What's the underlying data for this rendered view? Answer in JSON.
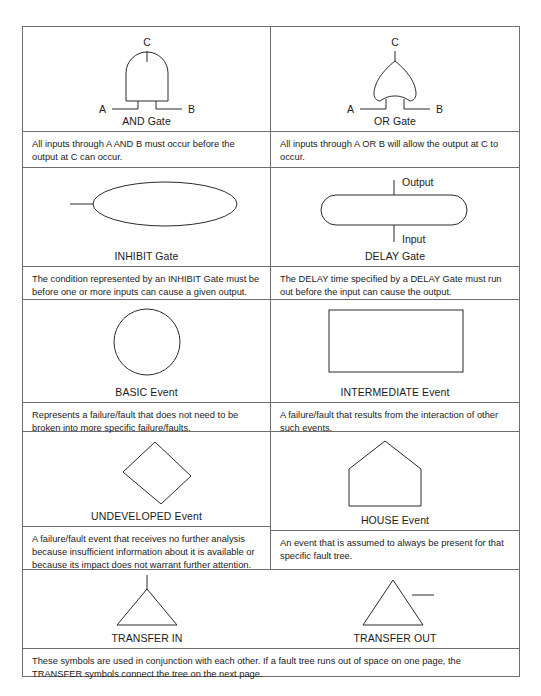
{
  "document": {
    "title": "Fault Tree Analysis Symbols",
    "type": "reference-table",
    "border_color": "#6e6e6e",
    "stroke_color": "#2a2a2a",
    "background": "#ffffff"
  },
  "rows": [
    {
      "cells": [
        {
          "symbol": "and-gate",
          "caption": "AND Gate",
          "labels": {
            "output": "C",
            "input_left": "A",
            "input_right": "B"
          },
          "description": "All inputs through A AND B must occur before the output at C can occur."
        },
        {
          "symbol": "or-gate",
          "caption": "OR Gate",
          "labels": {
            "output": "C",
            "input_left": "A",
            "input_right": "B"
          },
          "description": "All inputs through A OR B will allow the output at C to occur."
        }
      ]
    },
    {
      "cells": [
        {
          "symbol": "inhibit-gate",
          "caption": "INHIBIT Gate",
          "labels": {},
          "description": "The condition represented by an INHIBIT Gate must be before one or more inputs can cause a given output."
        },
        {
          "symbol": "delay-gate",
          "caption": "DELAY Gate",
          "labels": {
            "output": "Output",
            "input": "Input"
          },
          "description": "The DELAY time specified by a DELAY Gate must run out before the input can cause the output."
        }
      ]
    },
    {
      "cells": [
        {
          "symbol": "basic-event",
          "caption": "BASIC Event",
          "labels": {},
          "description": "Represents a failure/fault that does not need to be broken into more specific failure/faults."
        },
        {
          "symbol": "intermediate-event",
          "caption": "INTERMEDIATE Event",
          "labels": {},
          "description": "A failure/fault that results from the interaction of other such events."
        }
      ]
    },
    {
      "cells": [
        {
          "symbol": "undeveloped-event",
          "caption": "UNDEVELOPED Event",
          "labels": {},
          "description": "A failure/fault event that receives no further analysis because insufficient information about it is available or because its impact does not warrant further attention."
        },
        {
          "symbol": "house-event",
          "caption": "HOUSE Event",
          "labels": {},
          "description": "An event that is assumed to always be present for that specific fault tree."
        }
      ]
    }
  ],
  "transfer_row": {
    "symbols": [
      {
        "symbol": "transfer-in-triangle",
        "caption": "TRANSFER IN"
      },
      {
        "symbol": "transfer-out-triangle",
        "caption": "TRANSFER OUT"
      }
    ],
    "description": "These symbols are used in conjunction with each other. If a fault tree runs out of space on one page, the TRANSFER symbols connect the tree on the next page."
  }
}
